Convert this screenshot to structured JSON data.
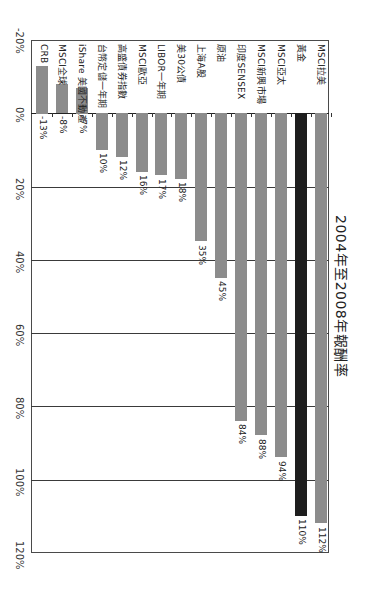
{
  "chart_data": {
    "type": "bar",
    "orientation": "rotated-90 (vertical bars growing downward on page)",
    "title": "2004年至2008年報酬率",
    "xlabel": "",
    "ylabel": "",
    "ylim": [
      -20,
      120
    ],
    "y_ticks": [
      "-20%",
      "0%",
      "20%",
      "40%",
      "60%",
      "80%",
      "100%",
      "120%"
    ],
    "grid": true,
    "legend": "none",
    "categories": [
      "CRB",
      "MSCI全球",
      "iShare 美國不動產",
      "台幣定儲一年期",
      "高盛債券指數",
      "MSCI歐亞",
      "LIBOR一年期",
      "美30公債",
      "上海A股",
      "原油",
      "印度SENSEX",
      "MSCI新興市場",
      "MSCI亞太",
      "黃金",
      "MSCI拉美"
    ],
    "values": [
      -13,
      -8,
      -7,
      10,
      12,
      16,
      17,
      18,
      35,
      45,
      84,
      88,
      94,
      110,
      112
    ],
    "value_labels": [
      "-13%",
      "-8%",
      "-7%",
      "10%",
      "12%",
      "16%",
      "17%",
      "18%",
      "35%",
      "45%",
      "84%",
      "88%",
      "94%",
      "110%",
      "112%"
    ],
    "highlight": {
      "category": "黃金",
      "color": "#1e1e1e"
    },
    "colors": {
      "bar": "#8c8c8c",
      "highlight": "#1e1e1e",
      "grid": "#3a3a3a"
    }
  }
}
